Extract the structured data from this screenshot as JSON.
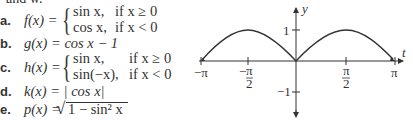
{
  "top_cut_text": "and w.",
  "problems": [
    {
      "label": "a.",
      "lhs": "f(x) =",
      "cases": [
        {
          "expr": "sin x,",
          "cond": "if x ≥ 0"
        },
        {
          "expr": "cos x,",
          "cond": "if x < 0"
        }
      ]
    },
    {
      "label": "b.",
      "lhs": "g(x) = cos x − 1"
    },
    {
      "label": "c.",
      "lhs": "h(x) =",
      "cases": [
        {
          "expr": "sin x,",
          "cond": "if x ≥ 0"
        },
        {
          "expr": "sin(−x),",
          "cond": "if x < 0"
        }
      ]
    },
    {
      "label": "d.",
      "lhs": "k(x) = | cos x|"
    },
    {
      "label": "e.",
      "lhs": "p(x) =",
      "radical": "1 − sin² x"
    }
  ],
  "graph": {
    "x_axis_label": "t",
    "y_axis_label": "y",
    "x_ticks": [
      "−π",
      "−π/2",
      "π/2",
      "π"
    ],
    "y_ticks": [
      "1",
      "−1"
    ],
    "curve": "y = |sin t| on [−π, π]",
    "line_color": "#333333"
  }
}
